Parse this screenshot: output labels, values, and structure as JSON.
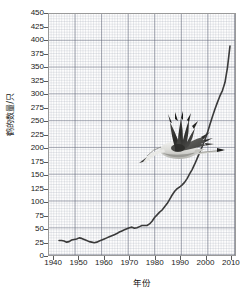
{
  "chart_data": {
    "type": "line",
    "title": "",
    "xlabel": "年份",
    "ylabel": "鹤的数量/只",
    "xlim": [
      1938,
      2012
    ],
    "ylim": [
      0,
      450
    ],
    "grid": true,
    "legend": false,
    "xticks": [
      1940,
      1950,
      1960,
      1970,
      1980,
      1990,
      2000,
      2010
    ],
    "yticks": [
      0,
      25,
      50,
      75,
      100,
      125,
      150,
      175,
      200,
      225,
      250,
      275,
      300,
      325,
      350,
      375,
      400,
      425,
      450
    ],
    "series": [
      {
        "name": "鹤的数量",
        "color": "#3a3a3a",
        "x": [
          1942,
          1943,
          1944,
          1945,
          1946,
          1947,
          1948,
          1949,
          1950,
          1951,
          1952,
          1953,
          1954,
          1955,
          1956,
          1957,
          1958,
          1959,
          1960,
          1961,
          1962,
          1963,
          1964,
          1965,
          1966,
          1967,
          1968,
          1969,
          1970,
          1971,
          1972,
          1973,
          1974,
          1975,
          1976,
          1977,
          1978,
          1979,
          1980,
          1981,
          1982,
          1983,
          1984,
          1985,
          1986,
          1987,
          1988,
          1989,
          1990,
          1991,
          1992,
          1993,
          1994,
          1995,
          1996,
          1997,
          1998,
          1999,
          2000,
          2001,
          2002,
          2003,
          2004,
          2005,
          2006,
          2007,
          2008,
          2009,
          2010
        ],
        "y": [
          27,
          27,
          26,
          24,
          25,
          28,
          29,
          30,
          32,
          31,
          29,
          27,
          25,
          24,
          23,
          24,
          26,
          28,
          30,
          32,
          34,
          36,
          38,
          40,
          43,
          45,
          47,
          49,
          51,
          52,
          50,
          51,
          53,
          55,
          55,
          55,
          58,
          63,
          70,
          75,
          80,
          84,
          90,
          96,
          104,
          112,
          119,
          124,
          127,
          131,
          136,
          143,
          152,
          160,
          170,
          181,
          192,
          203,
          215,
          228,
          243,
          258,
          272,
          285,
          297,
          307,
          322,
          350,
          390
        ]
      }
    ],
    "annotations": [
      {
        "name": "crane-photo",
        "description": "flying crane photograph overlay"
      }
    ]
  },
  "axes": {
    "y_title": "鹤的数量/只",
    "x_title": "年份"
  }
}
